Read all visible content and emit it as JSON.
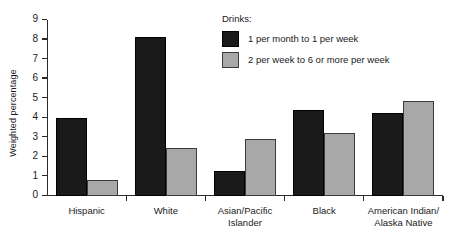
{
  "chart_data": {
    "type": "bar",
    "title": "",
    "xlabel": "",
    "ylabel": "Weighted percentage",
    "ylim": [
      0,
      9
    ],
    "yticks": [
      "0",
      "1",
      "2",
      "3",
      "4",
      "5",
      "6",
      "7",
      "8",
      "9"
    ],
    "grid": false,
    "legend_position": "top-right",
    "legend_title": "Drinks:",
    "categories": [
      "Hispanic",
      "White",
      "Asian/Pacific\nIslander",
      "Black",
      "American Indian/\nAlaska Native"
    ],
    "series": [
      {
        "name": "1 per month to 1 per week",
        "color": "#1a1a1a",
        "values": [
          4.0,
          8.15,
          1.3,
          4.4,
          4.25
        ]
      },
      {
        "name": "2 per week to 6 or more per week",
        "color": "#a8a8a8",
        "values": [
          0.8,
          2.45,
          2.9,
          3.2,
          4.85
        ]
      }
    ]
  }
}
